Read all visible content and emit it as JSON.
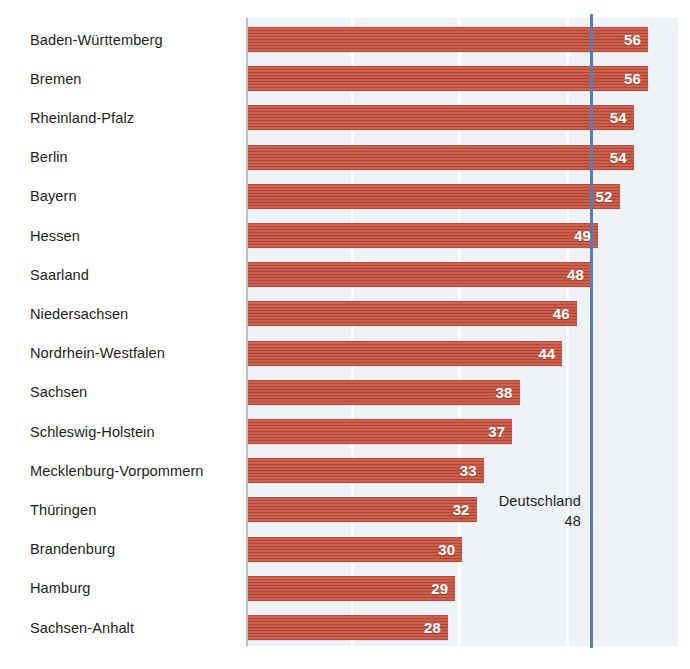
{
  "chart_data": {
    "type": "bar",
    "orientation": "horizontal",
    "title": "",
    "subtitle": "",
    "xlabel": "",
    "ylabel": "",
    "xlim": [
      0,
      60.5
    ],
    "grid": true,
    "gridlines": [
      15,
      30,
      45
    ],
    "legend": null,
    "categories": [
      "Baden-Württemberg",
      "Bremen",
      "Rheinland-Pfalz",
      "Berlin",
      "Bayern",
      "Hessen",
      "Saarland",
      "Niedersachsen",
      "Nordrhein-Westfalen",
      "Sachsen",
      "Schleswig-Holstein",
      "Mecklenburg-Vorpommern",
      "Thüringen",
      "Brandenburg",
      "Hamburg",
      "Sachsen-Anhalt"
    ],
    "values": [
      56,
      56,
      54,
      54,
      52,
      49,
      48,
      46,
      44,
      38,
      37,
      33,
      32,
      30,
      29,
      28
    ],
    "value_labels": [
      "56",
      "56",
      "54",
      "54",
      "52",
      "49",
      "48",
      "46",
      "44",
      "38",
      "37",
      "33",
      "32",
      "30",
      "29",
      "28"
    ],
    "reference_line": {
      "label": "Deutschland",
      "value": 48,
      "value_label": "48",
      "color": "#5b7bb4"
    },
    "colors": {
      "bar": "#c4503c",
      "plot_background": "#eef1f6",
      "page_background": "#ffffff",
      "text": "#1d1d1b",
      "value_text": "#ffffff",
      "axis": "#b9bcc2",
      "gridline": "#fdfdfe",
      "reference": "#5b7bb4"
    }
  },
  "rows": [
    {
      "label": "Baden-Württemberg",
      "value": 56,
      "value_label": "56"
    },
    {
      "label": "Bremen",
      "value": 56,
      "value_label": "56"
    },
    {
      "label": "Rheinland-Pfalz",
      "value": 54,
      "value_label": "54"
    },
    {
      "label": "Berlin",
      "value": 54,
      "value_label": "54"
    },
    {
      "label": "Bayern",
      "value": 52,
      "value_label": "52"
    },
    {
      "label": "Hessen",
      "value": 49,
      "value_label": "49"
    },
    {
      "label": "Saarland",
      "value": 48,
      "value_label": "48"
    },
    {
      "label": "Niedersachsen",
      "value": 46,
      "value_label": "46"
    },
    {
      "label": "Nordrhein-Westfalen",
      "value": 44,
      "value_label": "44"
    },
    {
      "label": "Sachsen",
      "value": 38,
      "value_label": "38"
    },
    {
      "label": "Schleswig-Holstein",
      "value": 37,
      "value_label": "37"
    },
    {
      "label": "Mecklenburg-Vorpommern",
      "value": 33,
      "value_label": "33"
    },
    {
      "label": "Thüringen",
      "value": 32,
      "value_label": "32"
    },
    {
      "label": "Brandenburg",
      "value": 30,
      "value_label": "30"
    },
    {
      "label": "Hamburg",
      "value": 29,
      "value_label": "29"
    },
    {
      "label": "Sachsen-Anhalt",
      "value": 28,
      "value_label": "28"
    }
  ],
  "reference": {
    "label": "Deutschland",
    "value_label": "48"
  }
}
